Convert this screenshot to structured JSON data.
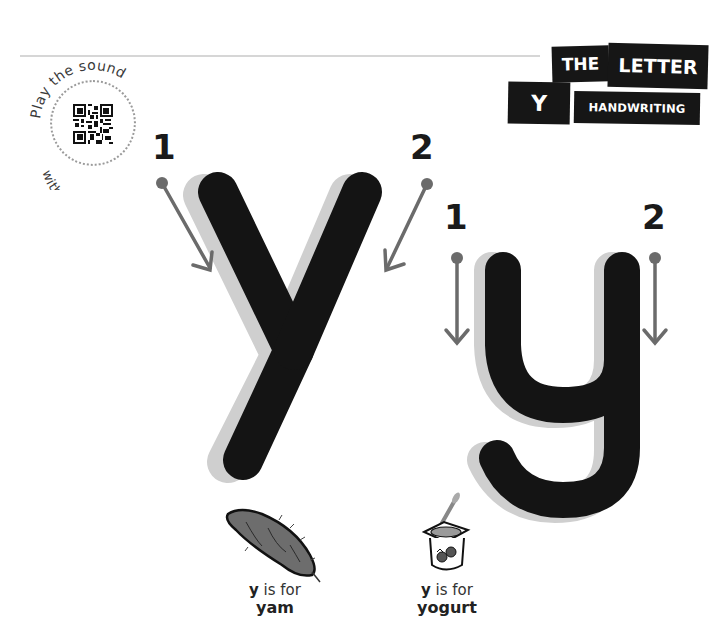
{
  "header": {
    "title_words": [
      "THE",
      "LETTER",
      "Y",
      "HANDWRITING"
    ],
    "the_label": "THE",
    "letter_label": "LETTER",
    "letter_char": "Y",
    "handwriting_label": "HANDWRITING"
  },
  "qr": {
    "top_text": "Play the sound",
    "bottom_text": "with the QR!",
    "icon": "qr-code-icon"
  },
  "uppercase": {
    "glyph": "Y",
    "strokes": [
      {
        "number": "1",
        "direction": "down-right"
      },
      {
        "number": "2",
        "direction": "down-left"
      }
    ]
  },
  "lowercase": {
    "glyph": "y",
    "strokes": [
      {
        "number": "1",
        "direction": "down"
      },
      {
        "number": "2",
        "direction": "down"
      }
    ]
  },
  "examples": [
    {
      "letter": "y",
      "connector": " is for",
      "word": "yam",
      "icon": "yam-icon"
    },
    {
      "letter": "y",
      "connector": " is for",
      "word": "yogurt",
      "icon": "yogurt-icon"
    }
  ],
  "colors": {
    "letter": "#141414",
    "shadow": "#cfcfcf",
    "arrow": "#6b6b6b",
    "label_bg": "#161616"
  }
}
